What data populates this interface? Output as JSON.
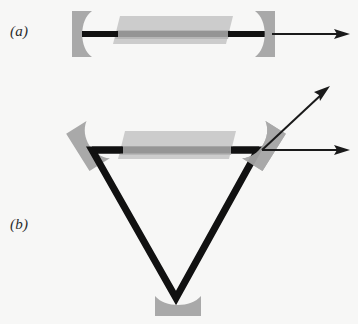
{
  "figure": {
    "type": "optical-cavity-diagram",
    "background_color": "#f7f7f6",
    "beam_color": "#111111",
    "mirror_color": "#a9a9a9",
    "gain_medium_color": "#c3c3c3",
    "gain_medium_core_color": "#b4b4b4",
    "panels": [
      {
        "id": "a",
        "label": "(a)",
        "description": "linear standing-wave laser cavity",
        "label_position": {
          "x": 10,
          "y": 23
        },
        "mirrors": [
          {
            "name": "left-end-mirror",
            "shape": "concave",
            "facing": "right",
            "x": 72,
            "y": 11,
            "width": 20,
            "height": 46
          },
          {
            "name": "right-output-coupler",
            "shape": "concave",
            "facing": "left",
            "x": 255,
            "y": 11,
            "width": 20,
            "height": 46
          }
        ],
        "gain_medium": {
          "name": "gain-medium-slab",
          "shape": "parallelogram",
          "x": 113,
          "y": 16,
          "width": 120,
          "height": 28
        },
        "intracavity_beam": {
          "x1": 82,
          "y1": 34,
          "x2": 266,
          "y2": 34,
          "thickness": 6
        },
        "output_beams": [
          {
            "name": "output-beam-horizontal",
            "x1": 275,
            "y1": 34,
            "x2": 349,
            "y2": 34,
            "thickness": 2,
            "arrowhead": true
          }
        ]
      },
      {
        "id": "b",
        "label": "(b)",
        "description": "triangular ring laser cavity",
        "label_position": {
          "x": 10,
          "y": 216
        },
        "mirrors": [
          {
            "name": "left-turning-mirror",
            "shape": "concave",
            "facing": "down-right",
            "cx": 88,
            "cy": 144,
            "rotation": -30
          },
          {
            "name": "right-output-coupler",
            "shape": "concave",
            "facing": "down-left",
            "cx": 264,
            "cy": 144,
            "rotation": 30
          },
          {
            "name": "bottom-mirror",
            "shape": "concave",
            "facing": "up",
            "x": 155,
            "y": 296,
            "width": 46,
            "height": 20
          }
        ],
        "gain_medium": {
          "name": "gain-medium-slab",
          "shape": "parallelogram",
          "x": 118,
          "y": 131,
          "width": 118,
          "height": 28
        },
        "intracavity_beam": {
          "vertices": [
            {
              "x": 92,
              "y": 150
            },
            {
              "x": 258,
              "y": 150
            },
            {
              "x": 176,
              "y": 298
            }
          ],
          "thickness": 7,
          "closed": true
        },
        "output_beams": [
          {
            "name": "output-beam-horizontal",
            "x1": 264,
            "y1": 150,
            "x2": 349,
            "y2": 150,
            "thickness": 2,
            "arrowhead": true
          },
          {
            "name": "output-beam-diagonal",
            "x1": 264,
            "y1": 150,
            "x2": 328,
            "y2": 88,
            "thickness": 2,
            "arrowhead": true
          }
        ]
      }
    ]
  }
}
